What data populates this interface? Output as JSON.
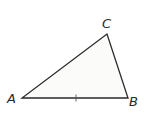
{
  "diagram": {
    "type": "triangle",
    "fill_color": "#fbfbfa",
    "stroke_color": "#2a2a2a",
    "vertices": {
      "A": {
        "label": "A",
        "x": 22,
        "y": 98
      },
      "B": {
        "label": "B",
        "x": 128,
        "y": 98
      },
      "C": {
        "label": "C",
        "x": 107,
        "y": 34
      }
    },
    "labels": {
      "A": "A",
      "B": "B",
      "C": "C"
    },
    "tick_mark": {
      "side": "AB",
      "x": 76,
      "y": 98
    }
  }
}
